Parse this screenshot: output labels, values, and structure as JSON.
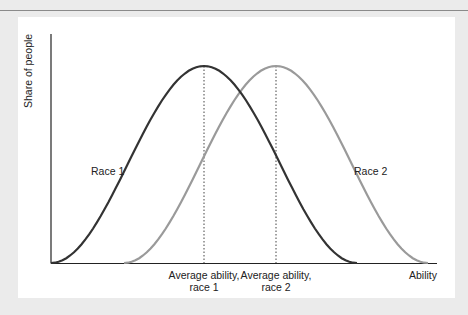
{
  "chart_data": {
    "type": "line",
    "title": "",
    "xlabel": "Ability",
    "ylabel": "Share of people",
    "grid": false,
    "legend": "inline labels",
    "series": [
      {
        "name": "Race 1",
        "color": "#333333",
        "distribution": "normal",
        "mean_label": "Average ability, race 1",
        "relative_mean": 0.4,
        "relative_peak": 1.0
      },
      {
        "name": "Race 2",
        "color": "#9a9a9a",
        "distribution": "normal",
        "mean_label": "Average ability, race 2",
        "relative_mean": 0.59,
        "relative_peak": 1.0
      }
    ],
    "annotations": [
      {
        "text": "Average ability, race 1",
        "type": "dotted vertical line at mean of Race 1"
      },
      {
        "text": "Average ability, race 2",
        "type": "dotted vertical line at mean of Race 2"
      }
    ],
    "xticks": [],
    "yticks": []
  },
  "labels": {
    "ylabel": "Share of people",
    "xlabel": "Ability",
    "race1": "Race 1",
    "race2": "Race 2",
    "mean1_line1": "Average ability,",
    "mean1_line2": "race 1",
    "mean2_line1": "Average ability,",
    "mean2_line2": "race 2"
  },
  "colors": {
    "race1": "#333333",
    "race2": "#9a9a9a",
    "axis": "#222222",
    "background": "#ebebeb",
    "panel": "#ffffff"
  }
}
